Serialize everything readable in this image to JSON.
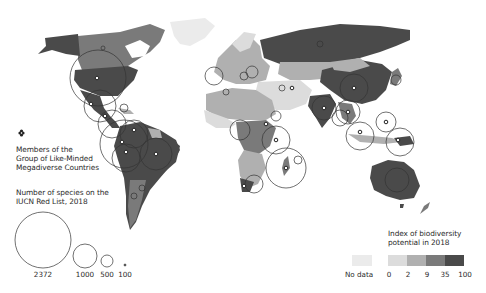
{
  "map": {
    "title": "Members of the Group of Like-Minded Megadiverse Countries and IUCN Red List species, 2018",
    "caption": "Figure 5.1 Distribution of biodiversity potential and threatened species"
  },
  "legend_members": {
    "icon": "flower-icon",
    "label_lines": [
      "Members of the",
      "Group of Like-Minded",
      "Megadiverse Countries"
    ]
  },
  "legend_species": {
    "title_lines": [
      "Number of species on the",
      "IUCN Red List, 2018"
    ],
    "sizes": [
      {
        "value": "2372",
        "radius": 28
      },
      {
        "value": "1000",
        "radius": 12
      },
      {
        "value": "500",
        "radius": 6
      },
      {
        "value": "100",
        "radius": 1
      }
    ]
  },
  "legend_index": {
    "title_lines": [
      "Index of biodiversity",
      "potential in 2018"
    ],
    "no_data_label": "No data",
    "no_data_color": "#ebebeb",
    "ticks": [
      "0",
      "2",
      "9",
      "35",
      "100"
    ],
    "colors": [
      "#dcdcdc",
      "#b0b0b0",
      "#7a7a7a",
      "#4a4a4a"
    ]
  },
  "colors": {
    "background": "#ffffff",
    "land_nodata": "#ebebeb",
    "level1": "#dcdcdc",
    "level2": "#b0b0b0",
    "level3": "#7a7a7a",
    "level4": "#4a4a4a",
    "circle_stroke": "#333333"
  }
}
